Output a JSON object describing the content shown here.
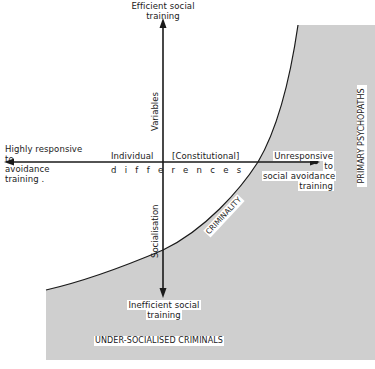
{
  "colors": {
    "shade": "#cfcfcf",
    "line": "#1a1a1a",
    "background": "#ffffff"
  },
  "axes": {
    "vertical": {
      "top_label_line1": "Efficient social",
      "top_label_line2": "training",
      "bottom_label_line1": "Inefficient social",
      "bottom_label_line2": "training",
      "upper_caption": "Variables",
      "lower_caption": "Socialisation"
    },
    "horizontal": {
      "left_label_line1": "Highly responsive",
      "left_label_line2": "to",
      "left_label_line3": "avoidance",
      "left_label_line4": "training .",
      "right_label_line1": "Unresponsive",
      "right_label_line2": "to",
      "right_label_line3": "social avoidance",
      "right_label_line4": "training",
      "caption_left": "Individual",
      "caption_right": "[Constitutional]",
      "caption_below": "differences"
    }
  },
  "regions": {
    "curve_label": "CRIMINALITY",
    "right_label": "PRIMARY PSYCHOPATHS",
    "bottom_label": "UNDER-SOCIALISED CRIMINALS"
  }
}
